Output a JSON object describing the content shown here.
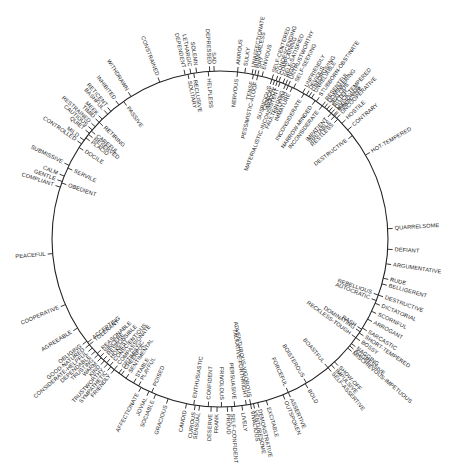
{
  "diagram": {
    "title": "",
    "center": [
      220,
      239
    ],
    "radius": 168,
    "line_color": "#222222",
    "angle_convention": "degrees, 0 = right (east), positive = clockwise",
    "labels": [
      {
        "text": "SAD",
        "angle": -92,
        "side": "outer"
      },
      {
        "text": "DEPRESSED",
        "angle": -93.5,
        "side": "outer"
      },
      {
        "text": "HELPLESS",
        "angle": -94,
        "side": "inner"
      },
      {
        "text": "SOLEMN",
        "angle": -98,
        "side": "outer"
      },
      {
        "text": "RECLUSIVE",
        "angle": -99,
        "side": "inner"
      },
      {
        "text": "LETHARGIC",
        "angle": -100,
        "side": "outer"
      },
      {
        "text": "SOLITARY",
        "angle": -101,
        "side": "inner"
      },
      {
        "text": "DEPENDENT",
        "angle": -102,
        "side": "outer"
      },
      {
        "text": "CONSTRAINED",
        "angle": -111,
        "side": "outer"
      },
      {
        "text": "WITHDRAWN",
        "angle": -122,
        "side": "outer"
      },
      {
        "text": "PASSIVE",
        "angle": -125,
        "side": "inner"
      },
      {
        "text": "INHIBITED",
        "angle": -127,
        "side": "outer"
      },
      {
        "text": "RETICENT",
        "angle": -130.5,
        "side": "outer"
      },
      {
        "text": "BASHFUL",
        "angle": -132,
        "side": "outer"
      },
      {
        "text": "MEEK",
        "angle": -134.5,
        "side": "outer"
      },
      {
        "text": "TIMID",
        "angle": -136,
        "side": "outer"
      },
      {
        "text": "RETIRING",
        "angle": -136,
        "side": "inner"
      },
      {
        "text": "RESTRAINED",
        "angle": -138,
        "side": "outer"
      },
      {
        "text": "CAUTIOUS",
        "angle": -139.5,
        "side": "outer"
      },
      {
        "text": "CAREFUL",
        "angle": -140,
        "side": "inner"
      },
      {
        "text": "QUIET",
        "angle": -141,
        "side": "outer"
      },
      {
        "text": "RESERVED",
        "angle": -141.5,
        "side": "inner"
      },
      {
        "text": "PLACID",
        "angle": -143,
        "side": "inner"
      },
      {
        "text": "MILD",
        "angle": -144,
        "side": "outer"
      },
      {
        "text": "CONTROLLED",
        "angle": -145.5,
        "side": "outer"
      },
      {
        "text": "DOCILE",
        "angle": -147,
        "side": "inner"
      },
      {
        "text": "SUBMISSIVE",
        "angle": -154,
        "side": "outer"
      },
      {
        "text": "SERVILE",
        "angle": -155,
        "side": "inner"
      },
      {
        "text": "CALM",
        "angle": -158,
        "side": "outer"
      },
      {
        "text": "GENTLE",
        "angle": -160,
        "side": "outer"
      },
      {
        "text": "OBEDIENT",
        "angle": -160.5,
        "side": "inner"
      },
      {
        "text": "COMPLIANT",
        "angle": -162,
        "side": "outer"
      },
      {
        "text": "PEACEFUL",
        "angle": 175,
        "side": "outer"
      },
      {
        "text": "COOPERATIVE",
        "angle": 157,
        "side": "outer"
      },
      {
        "text": "AGREEABLE",
        "angle": 148,
        "side": "outer"
      },
      {
        "text": "ACCEPTING",
        "angle": 142,
        "side": "inner"
      },
      {
        "text": "TOLERANT",
        "angle": 141,
        "side": "inner"
      },
      {
        "text": "OBLIGING",
        "angle": 142.5,
        "side": "outer"
      },
      {
        "text": "GOOD-NATURED",
        "angle": 141,
        "side": "outer"
      },
      {
        "text": "CONSIDERATE-HELPFUL",
        "angle": 139.5,
        "side": "outer"
      },
      {
        "text": "DEPENDABLE",
        "angle": 138,
        "side": "outer"
      },
      {
        "text": "TRUSTING",
        "angle": 136.5,
        "side": "outer"
      },
      {
        "text": "WARM",
        "angle": 135,
        "side": "outer"
      },
      {
        "text": "KIND",
        "angle": 133.5,
        "side": "outer"
      },
      {
        "text": "TRUSTWORTHY",
        "angle": 132,
        "side": "outer"
      },
      {
        "text": "SYMPATHETIC",
        "angle": 130.5,
        "side": "outer"
      },
      {
        "text": "FRIENDLY",
        "angle": 129,
        "side": "outer"
      },
      {
        "text": "REASONABLE",
        "angle": 137,
        "side": "inner"
      },
      {
        "text": "SINCERE",
        "angle": 135.5,
        "side": "inner"
      },
      {
        "text": "RESPONSIBLE",
        "angle": 134,
        "side": "inner"
      },
      {
        "text": "HONEST",
        "angle": 132.5,
        "side": "inner"
      },
      {
        "text": "CONSCIENTIOUS",
        "angle": 131,
        "side": "inner"
      },
      {
        "text": "COMPASSIONATE",
        "angle": 129,
        "side": "inner"
      },
      {
        "text": "OPTIMISTIC",
        "angle": 127,
        "side": "inner"
      },
      {
        "text": "CHEERFUL",
        "angle": 126,
        "side": "inner"
      },
      {
        "text": "SENTIMENTAL",
        "angle": 124,
        "side": "inner"
      },
      {
        "text": "STABLE",
        "angle": 121,
        "side": "inner"
      },
      {
        "text": "PLAYFUL",
        "angle": 119,
        "side": "inner"
      },
      {
        "text": "POISED",
        "angle": 114,
        "side": "inner"
      },
      {
        "text": "AFFECTIONATE",
        "angle": 118,
        "side": "outer"
      },
      {
        "text": "JOVIAL",
        "angle": 115,
        "side": "outer"
      },
      {
        "text": "SOCIABLE",
        "angle": 112.5,
        "side": "outer"
      },
      {
        "text": "GRACIOUS",
        "angle": 108,
        "side": "outer"
      },
      {
        "text": "CANDID",
        "angle": 101.5,
        "side": "outer"
      },
      {
        "text": "ENTHUSIASTIC",
        "angle": 99,
        "side": "inner"
      },
      {
        "text": "CURIOUS",
        "angle": 98.5,
        "side": "outer"
      },
      {
        "text": "SENSUAL",
        "angle": 97,
        "side": "outer"
      },
      {
        "text": "CONFIDENT",
        "angle": 94,
        "side": "inner"
      },
      {
        "text": "DESERVE",
        "angle": 93,
        "side": "outer"
      },
      {
        "text": "FRANK",
        "angle": 91,
        "side": "outer"
      },
      {
        "text": "FRIVOLOUS",
        "angle": 89.5,
        "side": "inner"
      },
      {
        "text": "PROUD",
        "angle": 87.5,
        "side": "outer"
      },
      {
        "text": "SELF-CONFIDENT",
        "angle": 86,
        "side": "outer"
      },
      {
        "text": "PERSUASIVE",
        "angle": 85,
        "side": "inner"
      },
      {
        "text": "LIVELY",
        "angle": 82.5,
        "side": "outer"
      },
      {
        "text": "TALKATIVE-FORTHRIGHT",
        "angle": 81,
        "side": "inner"
      },
      {
        "text": "ADVENTUROUS-VIGOROUS",
        "angle": 79.5,
        "side": "inner"
      },
      {
        "text": "VIVACIOUS",
        "angle": 79.5,
        "side": "outer"
      },
      {
        "text": "VENTURESOME",
        "angle": 78.5,
        "side": "outer"
      },
      {
        "text": "DEMONSTRATIVE",
        "angle": 77,
        "side": "outer"
      },
      {
        "text": "EXCITABLE",
        "angle": 74,
        "side": "outer"
      },
      {
        "text": "OUTSPOKEN",
        "angle": 68,
        "side": "outer"
      },
      {
        "text": "ASSERTIVE",
        "angle": 66,
        "side": "outer"
      },
      {
        "text": "FORCEFUL",
        "angle": 66,
        "side": "inner"
      },
      {
        "text": "BOLD",
        "angle": 59.5,
        "side": "outer"
      },
      {
        "text": "BOISTEROUS",
        "angle": 59,
        "side": "inner"
      },
      {
        "text": "BOASTFUL",
        "angle": 50,
        "side": "inner"
      },
      {
        "text": "SELF-ASSERTIVE",
        "angle": 50,
        "side": "outer"
      },
      {
        "text": "IMPULSIVE",
        "angle": 48.5,
        "side": "outer"
      },
      {
        "text": "SHOW-OFF",
        "angle": 47,
        "side": "outer"
      },
      {
        "text": "MISCHIEVOUS-IMPETUOUS",
        "angle": 40.5,
        "side": "outer"
      },
      {
        "text": "AGGRESSIVE",
        "angle": 39.5,
        "side": "outer"
      },
      {
        "text": "NAGGING",
        "angle": 38.5,
        "side": "outer"
      },
      {
        "text": "BOSSY",
        "angle": 36,
        "side": "outer"
      },
      {
        "text": "RECKLESS-TOUGH",
        "angle": 36,
        "side": "inner"
      },
      {
        "text": "SHORT-TEMPERED",
        "angle": 34,
        "side": "outer"
      },
      {
        "text": "DOMINATING",
        "angle": 33.5,
        "side": "inner"
      },
      {
        "text": "RASH",
        "angle": 32.5,
        "side": "inner"
      },
      {
        "text": "SARCASTIC",
        "angle": 32,
        "side": "outer"
      },
      {
        "text": "ARROGANT",
        "angle": 28.5,
        "side": "outer"
      },
      {
        "text": "SCORNFUL",
        "angle": 25.5,
        "side": "outer"
      },
      {
        "text": "DICTATORIAL",
        "angle": 22.5,
        "side": "outer"
      },
      {
        "text": "AUTOCRATIC",
        "angle": 21.5,
        "side": "inner"
      },
      {
        "text": "DESTRUCTIVE",
        "angle": 19.5,
        "side": "outer"
      },
      {
        "text": "REBELLIOUS",
        "angle": 19.5,
        "side": "inner"
      },
      {
        "text": "BELLIGERENT",
        "angle": 15.5,
        "side": "outer"
      },
      {
        "text": "RUDE",
        "angle": 13.5,
        "side": "outer"
      },
      {
        "text": "ARGUMENTATIVE",
        "angle": 8.5,
        "side": "outer"
      },
      {
        "text": "DEFIANT",
        "angle": 3.5,
        "side": "outer"
      },
      {
        "text": "QUARRELSOME",
        "angle": -3.5,
        "side": "outer"
      },
      {
        "text": "HOT-TEMPERED",
        "angle": -30,
        "side": "outer"
      },
      {
        "text": "DESTRUCTIVE",
        "angle": -38,
        "side": "inner"
      },
      {
        "text": "CONTRARY",
        "angle": -40.5,
        "side": "outer"
      },
      {
        "text": "HOSTILE",
        "angle": -43.5,
        "side": "outer"
      },
      {
        "text": "MALICIOUS",
        "angle": -47.5,
        "side": "outer"
      },
      {
        "text": "UNCOOPERATIVE",
        "angle": -46,
        "side": "outer"
      },
      {
        "text": "VINDICTIVE",
        "angle": -47,
        "side": "outer"
      },
      {
        "text": "QUICK-TEMPERED",
        "angle": -48.5,
        "side": "outer"
      },
      {
        "text": "BITTER",
        "angle": -49.5,
        "side": "outer"
      },
      {
        "text": "JEALOUS",
        "angle": -50.5,
        "side": "outer"
      },
      {
        "text": "DOMINEERING",
        "angle": -51.5,
        "side": "outer"
      },
      {
        "text": "RESENTFUL",
        "angle": -52.5,
        "side": "outer"
      },
      {
        "text": "STUBBORN-OBSTINATE",
        "angle": -55,
        "side": "outer"
      },
      {
        "text": "RESTLESS",
        "angle": -45.5,
        "side": "inner"
      },
      {
        "text": "IRRITABLE",
        "angle": -47,
        "side": "inner"
      },
      {
        "text": "IMPATIENT",
        "angle": -48.5,
        "side": "inner"
      },
      {
        "text": "INCONSIDERATE",
        "angle": -52.5,
        "side": "inner"
      },
      {
        "text": "UNRELIABLE",
        "angle": -57,
        "side": "outer"
      },
      {
        "text": "UNFORGIVING",
        "angle": -58,
        "side": "outer"
      },
      {
        "text": "DEVIOUS",
        "angle": -59,
        "side": "outer"
      },
      {
        "text": "UNFRIENDLY",
        "angle": -60.5,
        "side": "outer"
      },
      {
        "text": "NARROW-MINDED",
        "angle": -55.5,
        "side": "inner"
      },
      {
        "text": "SELF-SEEKING",
        "angle": -64,
        "side": "outer"
      },
      {
        "text": "UNTRUSTWORTHY",
        "angle": -66,
        "side": "outer"
      },
      {
        "text": "RIGID",
        "angle": -67,
        "side": "outer"
      },
      {
        "text": "SELF-SATISFIED",
        "angle": -68,
        "side": "outer"
      },
      {
        "text": "COMPLAINING",
        "angle": -69.5,
        "side": "outer"
      },
      {
        "text": "CONDESCENDING",
        "angle": -70.5,
        "side": "outer"
      },
      {
        "text": "SELF-CENTERED",
        "angle": -72,
        "side": "outer"
      },
      {
        "text": "ENVIOUS",
        "angle": -75.5,
        "side": "outer"
      },
      {
        "text": "SHY",
        "angle": -77,
        "side": "outer"
      },
      {
        "text": "HUMORLESS",
        "angle": -78,
        "side": "outer"
      },
      {
        "text": "UNAFFECTIONATE",
        "angle": -79,
        "side": "outer"
      },
      {
        "text": "SULKY",
        "angle": -81.5,
        "side": "outer"
      },
      {
        "text": "ANXIOUS",
        "angle": -84,
        "side": "outer"
      },
      {
        "text": "NERVOUS",
        "angle": -84,
        "side": "inner"
      },
      {
        "text": "TENSE",
        "angle": -78.5,
        "side": "inner"
      },
      {
        "text": "PESSIMISTIC-ALOOF",
        "angle": -77,
        "side": "inner"
      },
      {
        "text": "SUSPICIOUS",
        "angle": -72,
        "side": "inner"
      },
      {
        "text": "CYNICAL",
        "angle": -71,
        "side": "inner"
      },
      {
        "text": "MOODY",
        "angle": -70,
        "side": "inner"
      },
      {
        "text": "MATERIALISTIC-INCONSISTENT",
        "angle": -69,
        "side": "inner"
      },
      {
        "text": "FAULTFINDING",
        "angle": -67,
        "side": "inner"
      },
      {
        "text": "SELFISH",
        "angle": -66,
        "side": "inner"
      },
      {
        "text": "IMMATURE",
        "angle": -64.5,
        "side": "inner"
      },
      {
        "text": "INCONSIDERATE",
        "angle": -60,
        "side": "inner"
      }
    ]
  }
}
